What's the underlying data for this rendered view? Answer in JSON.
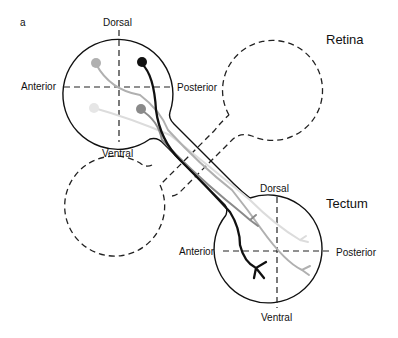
{
  "panel_label": "a",
  "retina": {
    "title": "Retina",
    "dorsal": "Dorsal",
    "ventral": "Ventral",
    "anterior": "Anterior",
    "posterior": "Posterior"
  },
  "tectum": {
    "title": "Tectum",
    "dorsal": "Dorsal",
    "ventral": "Ventral",
    "anterior": "Anterior",
    "posterior": "Posterior"
  },
  "colors": {
    "axon_black": "#111111",
    "axon_dark_gray": "#8a8a8a",
    "axon_mid_gray": "#b0b0b0",
    "axon_light_gray": "#dcdcdc"
  }
}
